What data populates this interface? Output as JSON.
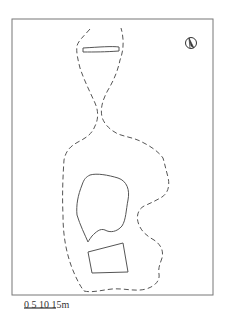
{
  "figure": {
    "type": "site plan",
    "colors": {
      "line": "#555555",
      "frame": "#777777",
      "background": "#ffffff"
    }
  },
  "north_arrow": {
    "icon": "north-arrow-icon"
  },
  "scale_bar": {
    "label": "0  5  10 15m",
    "ticks": [
      "0",
      "5",
      "10",
      "15m"
    ]
  }
}
